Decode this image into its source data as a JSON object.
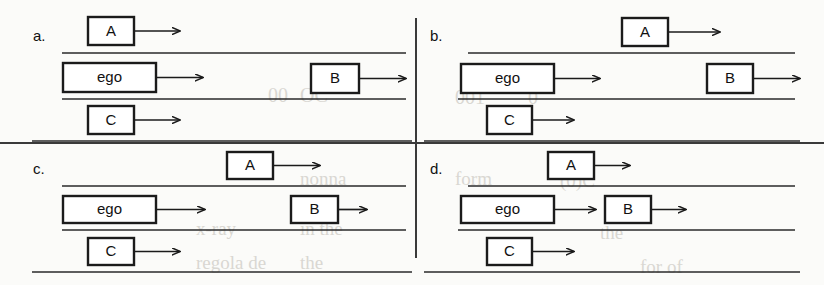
{
  "figure": {
    "colors": {
      "ink": "#1b1b1b",
      "lane": "#2a2a2a",
      "divider": "#3a3a3a",
      "paper": "#fbfbf9",
      "bleed_text": "#d9d7d2"
    },
    "dividers": {
      "vertical_label": "panel-divider-vertical",
      "horizontal_label": "panel-divider-horizontal"
    }
  },
  "bleed_text": [
    {
      "text": "00",
      "x": 268,
      "y": 84,
      "size": 20
    },
    {
      "text": "OC",
      "x": 300,
      "y": 84,
      "size": 20
    },
    {
      "text": "001",
      "x": 455,
      "y": 86,
      "size": 20
    },
    {
      "text": "0",
      "x": 528,
      "y": 86,
      "size": 20
    },
    {
      "text": "form",
      "x": 455,
      "y": 168,
      "size": 19
    },
    {
      "text": "nonna",
      "x": 300,
      "y": 168,
      "size": 19
    },
    {
      "text": "x-ray",
      "x": 196,
      "y": 218,
      "size": 19
    },
    {
      "text": "in the",
      "x": 300,
      "y": 218,
      "size": 19
    },
    {
      "text": "regola de",
      "x": 196,
      "y": 252,
      "size": 19
    },
    {
      "text": "the",
      "x": 300,
      "y": 252,
      "size": 19
    },
    {
      "text": "(0)C",
      "x": 560,
      "y": 170,
      "size": 19
    },
    {
      "text": "the",
      "x": 600,
      "y": 222,
      "size": 19
    },
    {
      "text": "for of",
      "x": 640,
      "y": 256,
      "size": 19
    }
  ],
  "panels": [
    {
      "id": "a",
      "label": "a.",
      "label_pos": {
        "x": 33,
        "y": 41
      },
      "lanes": [
        {
          "name": "lane-line-top",
          "x1": 62,
          "y1": 53,
          "x2": 406,
          "y2": 53
        },
        {
          "name": "lane-line-middle",
          "x1": 62,
          "y1": 99,
          "x2": 406,
          "y2": 99
        },
        {
          "name": "lane-line-bottom",
          "x1": 32,
          "y1": 141,
          "x2": 412,
          "y2": 141
        }
      ],
      "vehicles": [
        {
          "name": "vehicle-a",
          "label": "A",
          "x": 88,
          "y": 17,
          "w": 46,
          "h": 28,
          "arrow_to": 180
        },
        {
          "name": "vehicle-ego",
          "label": "ego",
          "x": 63,
          "y": 63,
          "w": 93,
          "h": 29,
          "arrow_to": 203
        },
        {
          "name": "vehicle-b",
          "label": "B",
          "x": 311,
          "y": 64,
          "w": 48,
          "h": 29,
          "arrow_to": 406
        },
        {
          "name": "vehicle-c",
          "label": "C",
          "x": 88,
          "y": 106,
          "w": 46,
          "h": 28,
          "arrow_to": 180
        }
      ]
    },
    {
      "id": "b",
      "label": "b.",
      "label_pos": {
        "x": 430,
        "y": 41
      },
      "lanes": [
        {
          "name": "lane-line-top",
          "x1": 468,
          "y1": 53,
          "x2": 795,
          "y2": 53
        },
        {
          "name": "lane-line-middle",
          "x1": 458,
          "y1": 99,
          "x2": 795,
          "y2": 99
        },
        {
          "name": "lane-line-bottom",
          "x1": 424,
          "y1": 141,
          "x2": 800,
          "y2": 141
        }
      ],
      "vehicles": [
        {
          "name": "vehicle-a",
          "label": "A",
          "x": 622,
          "y": 18,
          "w": 46,
          "h": 28,
          "arrow_to": 720
        },
        {
          "name": "vehicle-ego",
          "label": "ego",
          "x": 461,
          "y": 64,
          "w": 93,
          "h": 29,
          "arrow_to": 600
        },
        {
          "name": "vehicle-b",
          "label": "B",
          "x": 707,
          "y": 64,
          "w": 46,
          "h": 29,
          "arrow_to": 800
        },
        {
          "name": "vehicle-c",
          "label": "C",
          "x": 487,
          "y": 106,
          "w": 45,
          "h": 28,
          "arrow_to": 574
        }
      ]
    },
    {
      "id": "c",
      "label": "c.",
      "label_pos": {
        "x": 33,
        "y": 174
      },
      "lanes": [
        {
          "name": "lane-line-top",
          "x1": 62,
          "y1": 186,
          "x2": 406,
          "y2": 186
        },
        {
          "name": "lane-line-middle",
          "x1": 62,
          "y1": 230,
          "x2": 406,
          "y2": 230
        },
        {
          "name": "lane-line-bottom",
          "x1": 32,
          "y1": 272,
          "x2": 412,
          "y2": 272
        }
      ],
      "vehicles": [
        {
          "name": "vehicle-a",
          "label": "A",
          "x": 227,
          "y": 152,
          "w": 46,
          "h": 27,
          "arrow_to": 320
        },
        {
          "name": "vehicle-ego",
          "label": "ego",
          "x": 63,
          "y": 196,
          "w": 93,
          "h": 27,
          "arrow_to": 205
        },
        {
          "name": "vehicle-b",
          "label": "B",
          "x": 291,
          "y": 196,
          "w": 47,
          "h": 27,
          "arrow_to": 367
        },
        {
          "name": "vehicle-c",
          "label": "C",
          "x": 88,
          "y": 238,
          "w": 46,
          "h": 27,
          "arrow_to": 180
        }
      ]
    },
    {
      "id": "d",
      "label": "d.",
      "label_pos": {
        "x": 430,
        "y": 174
      },
      "lanes": [
        {
          "name": "lane-line-top",
          "x1": 468,
          "y1": 186,
          "x2": 795,
          "y2": 186
        },
        {
          "name": "lane-line-middle",
          "x1": 458,
          "y1": 230,
          "x2": 795,
          "y2": 230
        },
        {
          "name": "lane-line-bottom",
          "x1": 424,
          "y1": 272,
          "x2": 800,
          "y2": 272
        }
      ],
      "vehicles": [
        {
          "name": "vehicle-a",
          "label": "A",
          "x": 548,
          "y": 152,
          "w": 46,
          "h": 27,
          "arrow_to": 630
        },
        {
          "name": "vehicle-ego",
          "label": "ego",
          "x": 461,
          "y": 196,
          "w": 93,
          "h": 27,
          "arrow_to": 596
        },
        {
          "name": "vehicle-b",
          "label": "B",
          "x": 605,
          "y": 196,
          "w": 46,
          "h": 27,
          "arrow_to": 686
        },
        {
          "name": "vehicle-c",
          "label": "C",
          "x": 487,
          "y": 238,
          "w": 45,
          "h": 27,
          "arrow_to": 574
        }
      ]
    }
  ]
}
